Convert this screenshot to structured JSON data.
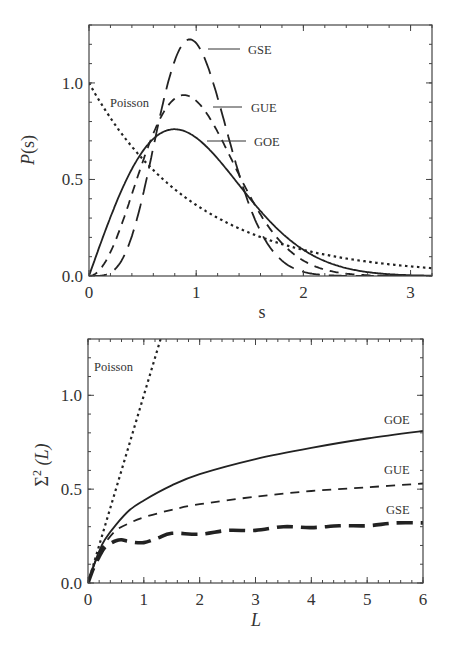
{
  "chart_data": [
    {
      "type": "line",
      "title": "",
      "xlabel": "s",
      "ylabel": "P(s)",
      "xlim": [
        0,
        3.2
      ],
      "ylim": [
        0,
        1.3
      ],
      "xticks": [
        "0",
        "1",
        "2",
        "3"
      ],
      "xtick_values": [
        0,
        1,
        2,
        3
      ],
      "yticks": [
        "0.0",
        "0.5",
        "1.0"
      ],
      "ytick_values": [
        0,
        0.5,
        1.0
      ],
      "grid": false,
      "legend": "inline labels",
      "series": [
        {
          "name": "Poisson",
          "style": "dotted",
          "formula": "exp(-s)",
          "x": [
            0,
            0.25,
            0.5,
            0.75,
            1,
            1.5,
            2,
            2.5,
            3,
            3.2
          ],
          "values": [
            1.0,
            0.78,
            0.61,
            0.47,
            0.37,
            0.22,
            0.14,
            0.08,
            0.05,
            0.04
          ]
        },
        {
          "name": "GOE",
          "style": "solid",
          "formula": "(pi/2) s exp(-pi s^2/4)",
          "x": [
            0,
            0.25,
            0.5,
            0.8,
            1,
            1.5,
            2,
            2.5,
            3
          ],
          "values": [
            0,
            0.37,
            0.64,
            0.76,
            0.72,
            0.4,
            0.14,
            0.03,
            0.01
          ]
        },
        {
          "name": "GUE",
          "style": "dashed",
          "formula": "(32/pi^2) s^2 exp(-4 s^2/pi)",
          "x": [
            0,
            0.25,
            0.5,
            0.89,
            1,
            1.5,
            2,
            2.5,
            3
          ],
          "values": [
            0,
            0.19,
            0.59,
            0.94,
            0.91,
            0.41,
            0.05,
            0.001,
            0
          ]
        },
        {
          "name": "GSE",
          "style": "long-dashed",
          "formula": "(2^18/(3^6 pi^3)) s^4 exp(-64 s^2/(9 pi))",
          "x": [
            0,
            0.25,
            0.5,
            0.94,
            1,
            1.5,
            2,
            2.5
          ],
          "values": [
            0,
            0.03,
            0.41,
            1.23,
            1.22,
            0.45,
            0.02,
            0
          ]
        }
      ]
    },
    {
      "type": "line",
      "title": "",
      "xlabel": "L",
      "ylabel": "Σ²(L)",
      "xlim": [
        0,
        6
      ],
      "ylim": [
        0,
        1.3
      ],
      "xticks": [
        "0",
        "1",
        "2",
        "3",
        "4",
        "5",
        "6"
      ],
      "xtick_values": [
        0,
        1,
        2,
        3,
        4,
        5,
        6
      ],
      "yticks": [
        "0.0",
        "0.5",
        "1.0"
      ],
      "ytick_values": [
        0,
        0.5,
        1.0
      ],
      "grid": false,
      "legend": "inline labels",
      "series": [
        {
          "name": "Poisson",
          "style": "dotted",
          "x": [
            0,
            1.3
          ],
          "values": [
            0,
            1.3
          ]
        },
        {
          "name": "GOE",
          "style": "solid",
          "x": [
            0,
            0.1,
            0.2,
            0.3,
            0.5,
            0.75,
            1,
            1.5,
            2,
            3,
            4,
            5,
            6
          ],
          "values": [
            0,
            0.09,
            0.17,
            0.23,
            0.31,
            0.39,
            0.44,
            0.52,
            0.58,
            0.66,
            0.72,
            0.77,
            0.81
          ]
        },
        {
          "name": "GUE",
          "style": "dashed",
          "x": [
            0,
            0.1,
            0.2,
            0.3,
            0.5,
            0.75,
            1,
            1.5,
            2,
            3,
            4,
            5,
            6
          ],
          "values": [
            0,
            0.09,
            0.16,
            0.21,
            0.28,
            0.32,
            0.35,
            0.39,
            0.42,
            0.46,
            0.49,
            0.51,
            0.53
          ]
        },
        {
          "name": "GSE",
          "style": "thick-dashed",
          "x": [
            0,
            0.1,
            0.2,
            0.3,
            0.4,
            0.5,
            0.6,
            0.75,
            1,
            1.25,
            1.5,
            2,
            2.5,
            3,
            3.5,
            4,
            4.5,
            5,
            5.5,
            6
          ],
          "values": [
            0,
            0.08,
            0.14,
            0.19,
            0.21,
            0.225,
            0.23,
            0.22,
            0.215,
            0.24,
            0.265,
            0.26,
            0.28,
            0.28,
            0.3,
            0.295,
            0.305,
            0.305,
            0.32,
            0.32
          ]
        }
      ]
    }
  ],
  "top_chart": {
    "xlabel": "s",
    "ylabel": "P(s)",
    "labels": {
      "poisson": "Poisson",
      "gse": "GSE",
      "gue": "GUE",
      "goe": "GOE"
    }
  },
  "bottom_chart": {
    "xlabel": "L",
    "ylabel_main": "Σ",
    "ylabel_sup": "2",
    "ylabel_arg": " (L)",
    "labels": {
      "poisson": "Poisson",
      "gse": "GSE",
      "gue": "GUE",
      "goe": "GOE"
    }
  }
}
